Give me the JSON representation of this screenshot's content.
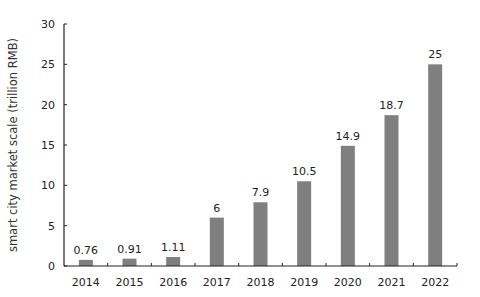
{
  "chart_data": {
    "type": "bar",
    "title": "",
    "xlabel": "",
    "ylabel": "smart city market scale (trillion RMB)",
    "categories": [
      "2014",
      "2015",
      "2016",
      "2017",
      "2018",
      "2019",
      "2020",
      "2021",
      "2022"
    ],
    "values": [
      0.76,
      0.91,
      1.11,
      6,
      7.9,
      10.5,
      14.9,
      18.7,
      25
    ],
    "data_labels": [
      "0.76",
      "0.91",
      "1.11",
      "6",
      "7.9",
      "10.5",
      "14.9",
      "18.7",
      "25"
    ],
    "ylim": [
      0,
      30
    ],
    "yticks": [
      0,
      5,
      10,
      15,
      20,
      25,
      30
    ],
    "grid": false,
    "legend": null,
    "bar_color": "#7f7f7f"
  }
}
